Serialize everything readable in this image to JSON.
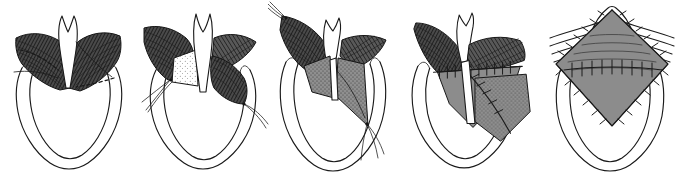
{
  "figure": {
    "style": "black and white pen-and-ink line drawing with cross-hatched muscle shading and stippled graft texture",
    "background_color": "#ffffff",
    "ink_color": "#1a1a1a",
    "muscle_shade_color": "#3a3a3a",
    "graft_shade_color": "#8c8c8c",
    "panel_count": 5,
    "width_px": 682,
    "height_px": 177
  },
  "panels": [
    {
      "index": 1,
      "step": "Step 1",
      "caption": "Anterior laryngeal view with planned incision lines marked",
      "detail": "Thyroid ala muscle shown in dark cross-hatching on both sides of the midline notch; dashed lines mark the proposed oblique incisions; the U-shaped tracheal outline lies below.",
      "annotations": [
        {
          "name": "midline-notch",
          "label": "Midline notch"
        },
        {
          "name": "left-muscle-mass",
          "label": "Left muscle mass"
        },
        {
          "name": "right-muscle-mass",
          "label": "Right muscle mass"
        },
        {
          "name": "incision-marking-left",
          "label": "Dashed incision line (left)"
        },
        {
          "name": "incision-marking-right",
          "label": "Dashed incision line (right)"
        },
        {
          "name": "tracheal-outline",
          "label": "Tracheal / cricoid outline"
        }
      ],
      "has_dashed_incision_lines": true,
      "has_sutures": false,
      "has_stipple_graft": false
    },
    {
      "index": 2,
      "step": "Step 2",
      "caption": "Flaps incised and elevated; retraction sutures placed",
      "detail": "Bilateral muscle flaps are raised and rotated outward exposing the stippled submucosal bed in the midline; two retraction suture threads emerge from the left inferior flap corner.",
      "annotations": [
        {
          "name": "elevated-left-flap",
          "label": "Elevated left flap"
        },
        {
          "name": "elevated-right-flap",
          "label": "Elevated right flap"
        },
        {
          "name": "exposed-submucosa",
          "label": "Exposed stippled submucosa"
        },
        {
          "name": "retraction-suture",
          "label": "Retraction suture threads"
        },
        {
          "name": "tracheal-outline",
          "label": "Tracheal / cricoid outline"
        }
      ],
      "has_dashed_incision_lines": false,
      "has_sutures": true,
      "has_stipple_graft": true
    },
    {
      "index": 3,
      "step": "Step 3",
      "caption": "Flaps transposed and interdigitated across the midline",
      "detail": "The two triangular flaps are crossed over one another in Z-plasty fashion; stay sutures are visible at the superior-left and inferior-right flap apices.",
      "annotations": [
        {
          "name": "transposed-left-flap",
          "label": "Transposed left flap"
        },
        {
          "name": "transposed-right-flap",
          "label": "Transposed right flap"
        },
        {
          "name": "stay-suture-superior",
          "label": "Superior stay suture"
        },
        {
          "name": "stay-suture-inferior",
          "label": "Inferior stay suture"
        },
        {
          "name": "tracheal-outline",
          "label": "Tracheal / cricoid outline"
        }
      ],
      "has_dashed_incision_lines": false,
      "has_sutures": true,
      "has_stipple_graft": true
    },
    {
      "index": 4,
      "step": "Step 4",
      "caption": "Interrupted sutures approximating the transposed flap edges",
      "detail": "A horizontal running row of interrupted sutures closes the upper flap edge; a second oblique suture line secures the inferior-right limb; the graft surface is shaded grey with stipple.",
      "annotations": [
        {
          "name": "horizontal-suture-line",
          "label": "Horizontal interrupted suture line"
        },
        {
          "name": "oblique-suture-line",
          "label": "Oblique suture line"
        },
        {
          "name": "transposed-flap",
          "label": "Transposed flap"
        },
        {
          "name": "tracheal-outline",
          "label": "Tracheal / cricoid outline"
        }
      ],
      "has_dashed_incision_lines": false,
      "has_sutures": true,
      "has_stipple_graft": true
    },
    {
      "index": 5,
      "step": "Step 5",
      "caption": "Completed closure — diamond-shaped graft sutured in place",
      "detail": "Final result showing the rhomboid/diamond graft fully inset in the anterior midline, circumferentially sutured, with the overlying strap muscle striations reapproximated above.",
      "annotations": [
        {
          "name": "diamond-graft",
          "label": "Diamond-shaped graft"
        },
        {
          "name": "circumferential-suture-line",
          "label": "Circumferential suture line"
        },
        {
          "name": "muscle-striations",
          "label": "Overlying muscle striations"
        },
        {
          "name": "tracheal-outline",
          "label": "Tracheal / cricoid outline"
        }
      ],
      "has_dashed_incision_lines": false,
      "has_sutures": true,
      "has_stipple_graft": true
    }
  ]
}
